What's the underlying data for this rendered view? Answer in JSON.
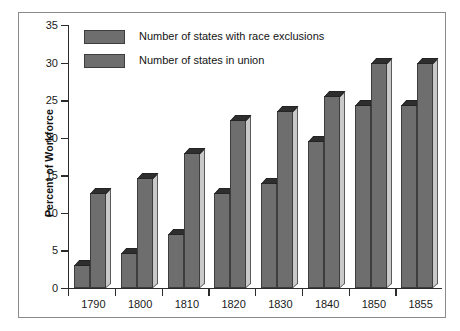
{
  "chart_data": {
    "type": "bar",
    "title": "",
    "xlabel": "",
    "ylabel": "Percent of Workforce",
    "categories": [
      "1790",
      "1800",
      "1810",
      "1820",
      "1830",
      "1840",
      "1850",
      "1855"
    ],
    "series": [
      {
        "name": "Number of states with race exclusions",
        "values": [
          3.0,
          4.7,
          7.2,
          12.6,
          14.0,
          19.5,
          24.3,
          24.3
        ],
        "color": "#6e6e6e"
      },
      {
        "name": "Number of states in union",
        "values": [
          12.7,
          14.7,
          17.9,
          22.3,
          23.6,
          25.5,
          30.0,
          30.0
        ],
        "color": "#6e6e6e"
      }
    ],
    "ylim": [
      0,
      35
    ],
    "yticks": [
      0,
      5,
      10,
      15,
      20,
      25,
      30,
      35
    ],
    "ytick_labels": [
      "0",
      "5",
      "10",
      "15",
      "20",
      "25",
      "30",
      "35"
    ],
    "grid": false,
    "legend_position": "top-left",
    "bar_style": "3d-extruded",
    "colors": {
      "bar_front": "#6e6e6e",
      "bar_top": "#2e2e2e",
      "bar_side": "#c9c9c9",
      "axis": "#2b2b2b",
      "frame": "#8a8a8a",
      "background": "#ffffff",
      "text": "#1a1a1a"
    }
  }
}
